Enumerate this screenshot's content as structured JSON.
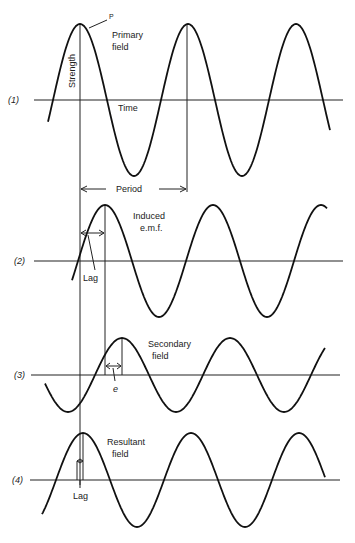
{
  "figure": {
    "rows": [
      {
        "id": "1",
        "label": "(1)",
        "title_line1": "Primary",
        "title_line2": "field",
        "extra_labels": {
          "axis_y": "Strength",
          "axis_x": "Time",
          "marker": "P"
        }
      },
      {
        "id": "2",
        "label": "(2)",
        "title_line1": "Induced",
        "title_line2": "e.m.f.",
        "extra_labels": {
          "lag": "Lag"
        }
      },
      {
        "id": "3",
        "label": "(3)",
        "title_line1": "Secondary",
        "title_line2": "field",
        "extra_labels": {
          "phase": "e"
        }
      },
      {
        "id": "4",
        "label": "(4)",
        "title_line1": "Resultant",
        "title_line2": "field",
        "extra_labels": {
          "lag": "Lag"
        }
      }
    ],
    "period_label": "Period"
  },
  "chart_data": {
    "type": "line",
    "title": "",
    "xlabel": "Time",
    "ylabel": "Strength",
    "series": [
      {
        "name": "Primary field",
        "amplitude": 1.0,
        "phase_lag_deg": 0
      },
      {
        "name": "Induced e.m.f.",
        "amplitude": 0.75,
        "phase_lag_deg": 90
      },
      {
        "name": "Secondary field",
        "amplitude": 0.5,
        "phase_lag_deg": 150
      },
      {
        "name": "Resultant field",
        "amplitude": 0.62,
        "phase_lag_deg": 10
      }
    ],
    "annotations": [
      "P",
      "Period",
      "Lag",
      "e",
      "Lag"
    ]
  }
}
